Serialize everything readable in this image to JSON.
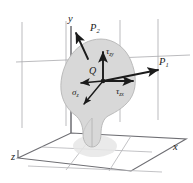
{
  "figure": {
    "name": "stress-components-at-point-q",
    "type": "3d-mechanics-diagram",
    "colors": {
      "background": "#ffffff",
      "grid_line": "#a9a9ad",
      "axis_line": "#6d6d72",
      "floor_line": "#6e6e73",
      "body_fill": "#d6d6d6",
      "body_edge": "#b4b4b4",
      "shadow_fill": "#e4e4e4",
      "arrow": "#1b1b1b",
      "text": "#1b1b1b"
    }
  },
  "axes": {
    "y": {
      "label": "y",
      "x": 71,
      "y": 20
    },
    "x": {
      "label": "x",
      "x": 175,
      "y": 148
    },
    "z": {
      "label": "z",
      "x": 12,
      "y": 158
    }
  },
  "point": {
    "label": "Q",
    "x": 93,
    "y": 73
  },
  "forces": [
    {
      "name": "force-p2",
      "base": "P",
      "sub": "2",
      "x": 93,
      "y": 28
    },
    {
      "name": "force-p1",
      "base": "P",
      "sub": "1",
      "x": 161,
      "y": 63
    }
  ],
  "stresses": [
    {
      "name": "shear-stress-zy",
      "base": "τ",
      "sub": "zy",
      "x": 107,
      "y": 52
    },
    {
      "name": "normal-stress-z",
      "base": "σ",
      "sub": "z",
      "x": 74,
      "y": 93
    },
    {
      "name": "shear-stress-zx",
      "base": "τ",
      "sub": "zx",
      "x": 118,
      "y": 92
    }
  ]
}
